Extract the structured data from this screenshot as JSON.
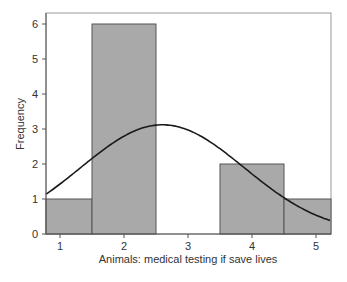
{
  "chart_data": {
    "type": "bar",
    "subtype": "histogram with normal curve",
    "title": "",
    "xlabel": "Animals: medical testing if save lives",
    "ylabel": "Frequency",
    "categories": [
      "1",
      "2",
      "3",
      "4",
      "5"
    ],
    "values": [
      1,
      6,
      0,
      2,
      1
    ],
    "x_ticks": [
      1,
      2,
      3,
      4,
      5
    ],
    "y_ticks": [
      0,
      1,
      2,
      3,
      4,
      5,
      6
    ],
    "ylim": [
      0,
      6.2
    ],
    "xlim": [
      0.78,
      5.22
    ],
    "grid": false,
    "legend": null,
    "bar_color": "#a9a9a9",
    "normal_curve": {
      "mean": 2.6,
      "sd": 1.28,
      "peak": 3.12,
      "color": "#1a1a1a"
    }
  },
  "axes": {
    "x_label": "Animals: medical testing if save lives",
    "y_label": "Frequency"
  }
}
